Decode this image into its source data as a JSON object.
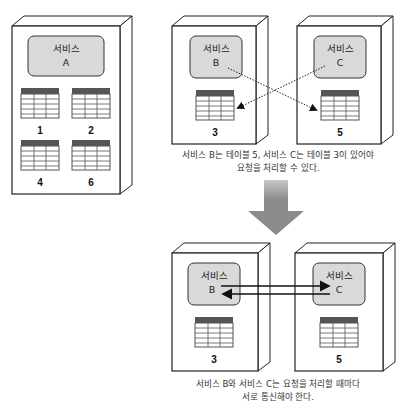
{
  "top_left": {
    "server": {
      "service_name": "서비스",
      "service_id": "A",
      "tables": [
        "1",
        "2",
        "4",
        "6"
      ]
    }
  },
  "top_right": {
    "servers": [
      {
        "service_name": "서비스",
        "service_id": "B",
        "table": "3"
      },
      {
        "service_name": "서비스",
        "service_id": "C",
        "table": "5"
      }
    ],
    "caption_line1": "서비스 B는 테이블 5, 서비스 C는 테이블 3이 있어야",
    "caption_line2": "요청을 처리할 수 있다."
  },
  "bottom": {
    "servers": [
      {
        "service_name": "서비스",
        "service_id": "B",
        "table": "3"
      },
      {
        "service_name": "서비스",
        "service_id": "C",
        "table": "5"
      }
    ],
    "caption_line1": "서비스 B와 서비스 C는 요청을 처리할 때마다",
    "caption_line2": "서로 통신해야 한다."
  },
  "colors": {
    "service_box": "#d9d9d9",
    "table_header": "#555555",
    "down_arrow": "#8c8c8c"
  }
}
